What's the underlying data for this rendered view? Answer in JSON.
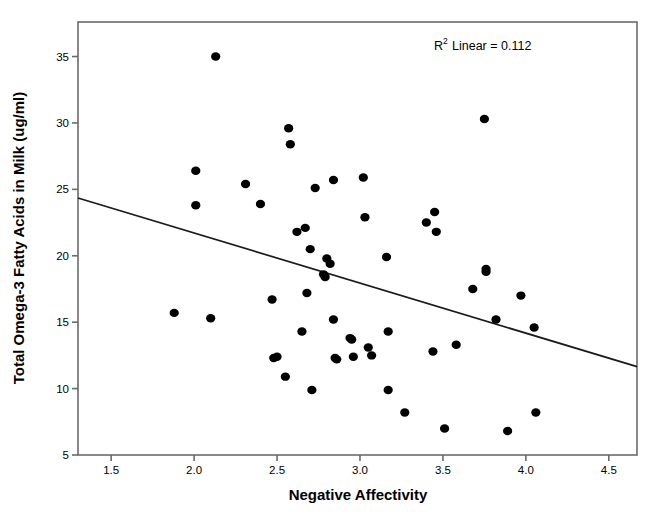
{
  "figure": {
    "background_color": "#ffffff",
    "frame_color": "#6b6b6b",
    "point_color": "#000000",
    "line_color": "#1a1a1a"
  },
  "annotation": {
    "r_base": "R",
    "r_exponent": "2",
    "r_text": "Linear = 0.112",
    "full_text": "R² Linear = 0.112"
  },
  "axes": {
    "x_title": "Negative Affectivity",
    "y_title": "Total Omega-3 Fatty Acids in Milk (ug/ml)",
    "x_ticks": [
      "1.5",
      "2.0",
      "2.5",
      "3.0",
      "3.5",
      "4.0",
      "4.5"
    ],
    "y_ticks": [
      "5",
      "10",
      "15",
      "20",
      "25",
      "30",
      "35"
    ]
  },
  "chart_data": {
    "type": "scatter",
    "title": "",
    "xlabel": "Negative Affectivity",
    "ylabel": "Total Omega-3 Fatty Acids in Milk (ug/ml)",
    "xlim": [
      1.3,
      4.67
    ],
    "ylim": [
      5.0,
      37.6
    ],
    "xticks": [
      1.5,
      2.0,
      2.5,
      3.0,
      3.5,
      4.0,
      4.5
    ],
    "yticks": [
      5,
      10,
      15,
      20,
      25,
      30,
      35
    ],
    "grid": false,
    "legend": "none",
    "annotations": [
      {
        "text": "R² Linear = 0.112",
        "x": 4.05,
        "y": 36.5
      }
    ],
    "r_squared": 0.112,
    "trendline": {
      "type": "linear",
      "x_start": 1.3,
      "y_start": 24.35,
      "x_end": 4.67,
      "y_end": 11.65,
      "slope": -3.77,
      "intercept": 29.25
    },
    "points": [
      {
        "x": 1.88,
        "y": 15.7
      },
      {
        "x": 2.01,
        "y": 26.4
      },
      {
        "x": 2.01,
        "y": 23.8
      },
      {
        "x": 2.1,
        "y": 15.3
      },
      {
        "x": 2.13,
        "y": 35.0
      },
      {
        "x": 2.31,
        "y": 25.4
      },
      {
        "x": 2.4,
        "y": 23.9
      },
      {
        "x": 2.47,
        "y": 16.7
      },
      {
        "x": 2.48,
        "y": 12.3
      },
      {
        "x": 2.5,
        "y": 12.4
      },
      {
        "x": 2.55,
        "y": 10.9
      },
      {
        "x": 2.57,
        "y": 29.6
      },
      {
        "x": 2.58,
        "y": 28.4
      },
      {
        "x": 2.62,
        "y": 21.8
      },
      {
        "x": 2.65,
        "y": 14.3
      },
      {
        "x": 2.67,
        "y": 22.1
      },
      {
        "x": 2.68,
        "y": 17.2
      },
      {
        "x": 2.7,
        "y": 20.5
      },
      {
        "x": 2.71,
        "y": 9.9
      },
      {
        "x": 2.73,
        "y": 25.1
      },
      {
        "x": 2.78,
        "y": 18.6
      },
      {
        "x": 2.79,
        "y": 18.4
      },
      {
        "x": 2.8,
        "y": 19.8
      },
      {
        "x": 2.82,
        "y": 19.4
      },
      {
        "x": 2.84,
        "y": 25.7
      },
      {
        "x": 2.84,
        "y": 15.2
      },
      {
        "x": 2.85,
        "y": 12.3
      },
      {
        "x": 2.86,
        "y": 12.2
      },
      {
        "x": 2.94,
        "y": 13.8
      },
      {
        "x": 2.95,
        "y": 13.7
      },
      {
        "x": 2.96,
        "y": 12.4
      },
      {
        "x": 3.02,
        "y": 25.9
      },
      {
        "x": 3.03,
        "y": 22.9
      },
      {
        "x": 3.05,
        "y": 13.1
      },
      {
        "x": 3.07,
        "y": 12.5
      },
      {
        "x": 3.16,
        "y": 19.9
      },
      {
        "x": 3.17,
        "y": 14.3
      },
      {
        "x": 3.17,
        "y": 9.9
      },
      {
        "x": 3.27,
        "y": 8.2
      },
      {
        "x": 3.4,
        "y": 22.5
      },
      {
        "x": 3.44,
        "y": 12.8
      },
      {
        "x": 3.45,
        "y": 23.3
      },
      {
        "x": 3.46,
        "y": 21.8
      },
      {
        "x": 3.51,
        "y": 7.0
      },
      {
        "x": 3.58,
        "y": 13.3
      },
      {
        "x": 3.68,
        "y": 17.5
      },
      {
        "x": 3.75,
        "y": 30.3
      },
      {
        "x": 3.76,
        "y": 19.0
      },
      {
        "x": 3.76,
        "y": 18.8
      },
      {
        "x": 3.82,
        "y": 15.2
      },
      {
        "x": 3.89,
        "y": 6.8
      },
      {
        "x": 3.97,
        "y": 17.0
      },
      {
        "x": 4.05,
        "y": 14.6
      },
      {
        "x": 4.06,
        "y": 8.2
      }
    ]
  },
  "geometry": {
    "plot_left": 78,
    "plot_right": 637,
    "plot_top": 22,
    "plot_bottom": 455,
    "x_min": 1.3,
    "x_max": 4.67,
    "y_min": 5.0,
    "y_max": 37.6,
    "point_radius": 4.6
  }
}
